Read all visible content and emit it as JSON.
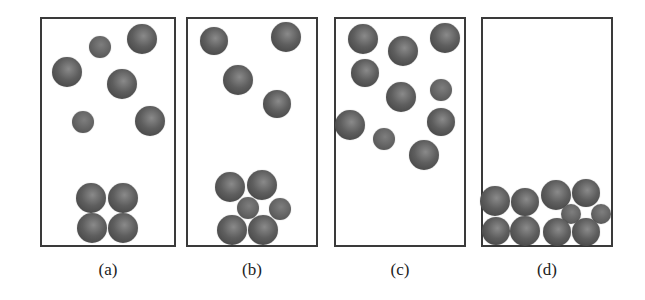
{
  "figure": {
    "panels": [
      {
        "id": "a",
        "caption": "(a)",
        "box": {
          "x": 40,
          "y": 17,
          "w": 136,
          "h": 230
        },
        "balls": [
          {
            "x": 100,
            "y": 47,
            "r": 11,
            "size": "small"
          },
          {
            "x": 142,
            "y": 39,
            "r": 15,
            "size": "large"
          },
          {
            "x": 67,
            "y": 72,
            "r": 15,
            "size": "large"
          },
          {
            "x": 122,
            "y": 84,
            "r": 15,
            "size": "large"
          },
          {
            "x": 83,
            "y": 122,
            "r": 11,
            "size": "small"
          },
          {
            "x": 150,
            "y": 121,
            "r": 15,
            "size": "large"
          },
          {
            "x": 91,
            "y": 198,
            "r": 15,
            "size": "large"
          },
          {
            "x": 123,
            "y": 198,
            "r": 15,
            "size": "large"
          },
          {
            "x": 92,
            "y": 228,
            "r": 15,
            "size": "large"
          },
          {
            "x": 123,
            "y": 228,
            "r": 15,
            "size": "large"
          }
        ]
      },
      {
        "id": "b",
        "caption": "(b)",
        "box": {
          "x": 186,
          "y": 17,
          "w": 132,
          "h": 230
        },
        "balls": [
          {
            "x": 214,
            "y": 41,
            "r": 14,
            "size": "large"
          },
          {
            "x": 286,
            "y": 37,
            "r": 15,
            "size": "large"
          },
          {
            "x": 238,
            "y": 80,
            "r": 15,
            "size": "large"
          },
          {
            "x": 277,
            "y": 104,
            "r": 14,
            "size": "large"
          },
          {
            "x": 230,
            "y": 187,
            "r": 15,
            "size": "large"
          },
          {
            "x": 262,
            "y": 185,
            "r": 15,
            "size": "large"
          },
          {
            "x": 248,
            "y": 208,
            "r": 11,
            "size": "small"
          },
          {
            "x": 280,
            "y": 209,
            "r": 11,
            "size": "small"
          },
          {
            "x": 232,
            "y": 230,
            "r": 15,
            "size": "large"
          },
          {
            "x": 263,
            "y": 230,
            "r": 15,
            "size": "large"
          }
        ]
      },
      {
        "id": "c",
        "caption": "(c)",
        "box": {
          "x": 334,
          "y": 17,
          "w": 132,
          "h": 230
        },
        "balls": [
          {
            "x": 363,
            "y": 39,
            "r": 15,
            "size": "large"
          },
          {
            "x": 403,
            "y": 51,
            "r": 15,
            "size": "large"
          },
          {
            "x": 445,
            "y": 38,
            "r": 15,
            "size": "large"
          },
          {
            "x": 365,
            "y": 73,
            "r": 14,
            "size": "large"
          },
          {
            "x": 401,
            "y": 97,
            "r": 15,
            "size": "large"
          },
          {
            "x": 441,
            "y": 90,
            "r": 11,
            "size": "small"
          },
          {
            "x": 350,
            "y": 125,
            "r": 15,
            "size": "large"
          },
          {
            "x": 384,
            "y": 139,
            "r": 11,
            "size": "small"
          },
          {
            "x": 441,
            "y": 122,
            "r": 14,
            "size": "large"
          },
          {
            "x": 424,
            "y": 155,
            "r": 15,
            "size": "large"
          }
        ]
      },
      {
        "id": "d",
        "caption": "(d)",
        "box": {
          "x": 481,
          "y": 17,
          "w": 132,
          "h": 230
        },
        "balls": [
          {
            "x": 495,
            "y": 201,
            "r": 15,
            "size": "large"
          },
          {
            "x": 525,
            "y": 202,
            "r": 14,
            "size": "large"
          },
          {
            "x": 556,
            "y": 195,
            "r": 15,
            "size": "large"
          },
          {
            "x": 586,
            "y": 193,
            "r": 14,
            "size": "large"
          },
          {
            "x": 571,
            "y": 214,
            "r": 10,
            "size": "small"
          },
          {
            "x": 601,
            "y": 214,
            "r": 10,
            "size": "small"
          },
          {
            "x": 496,
            "y": 231,
            "r": 14,
            "size": "large"
          },
          {
            "x": 525,
            "y": 231,
            "r": 15,
            "size": "large"
          },
          {
            "x": 557,
            "y": 232,
            "r": 14,
            "size": "large"
          },
          {
            "x": 586,
            "y": 232,
            "r": 14,
            "size": "large"
          }
        ]
      }
    ],
    "colors": {
      "border": "#3a3a3a",
      "ball_highlight": "#8a8a8a",
      "ball_mid": "#5e5e5e",
      "ball_shadow": "#3c3c3c",
      "caption": "#222222"
    }
  }
}
